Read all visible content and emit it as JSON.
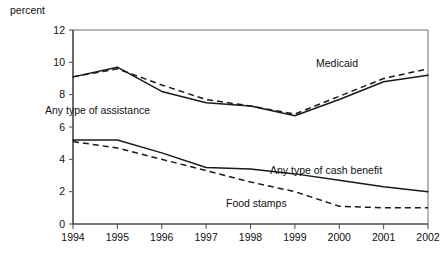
{
  "chart_data": {
    "type": "line",
    "title": "",
    "subtitle": "",
    "xlabel": "",
    "ylabel": "percent",
    "ylabel_position": "top-left",
    "categories": [
      1994,
      1995,
      1996,
      1997,
      1998,
      1999,
      2000,
      2001,
      2002
    ],
    "x": [
      1994,
      1995,
      1996,
      1997,
      1998,
      1999,
      2000,
      2001,
      2002
    ],
    "xlim": [
      1994,
      2002
    ],
    "ylim": [
      0,
      12
    ],
    "yticks": [
      0,
      2,
      4,
      6,
      8,
      10,
      12
    ],
    "ytick_labels": [
      "0",
      "2",
      "4",
      "6",
      "8",
      "10",
      "12"
    ],
    "xtick_labels": [
      "1994",
      "1995",
      "1996",
      "1997",
      "1998",
      "1999",
      "2000",
      "2001",
      "2002"
    ],
    "grid": false,
    "legend_position": "inline-annotations",
    "series": [
      {
        "name": "Any type of assistance",
        "style": "solid",
        "color": "#1a1a1a",
        "values": [
          9.1,
          9.7,
          8.2,
          7.5,
          7.3,
          6.7,
          7.7,
          8.8,
          9.2
        ]
      },
      {
        "name": "Medicaid",
        "style": "dashed",
        "color": "#1a1a1a",
        "values": [
          9.1,
          9.6,
          8.6,
          7.7,
          7.3,
          6.8,
          7.9,
          9.0,
          9.6
        ]
      },
      {
        "name": "Any type of cash benefit",
        "style": "solid",
        "color": "#1a1a1a",
        "values": [
          5.2,
          5.2,
          4.4,
          3.5,
          3.4,
          3.1,
          2.7,
          2.3,
          2.0
        ]
      },
      {
        "name": "Food stamps",
        "style": "dashed",
        "color": "#1a1a1a",
        "values": [
          5.1,
          4.7,
          4.0,
          3.3,
          2.6,
          2.0,
          1.1,
          1.0,
          1.0
        ]
      }
    ],
    "annotations": [
      {
        "text": "Any type of assistance",
        "x_px": 45,
        "y_px": 114
      },
      {
        "text": "Medicaid",
        "x_px": 316,
        "y_px": 67
      },
      {
        "text": "Any type of cash benefit",
        "x_px": 270,
        "y_px": 174
      },
      {
        "text": "Food stamps",
        "x_px": 226,
        "y_px": 207
      }
    ]
  },
  "axes": {
    "y_unit_label": "percent",
    "y_unit_label_x_px": 10,
    "y_unit_label_y_px": 14
  },
  "colors": {
    "line": "#1a1a1a",
    "frame": "#6f6f6f",
    "tick": "#4a4a4a",
    "text": "#111111",
    "background": "#ffffff"
  }
}
